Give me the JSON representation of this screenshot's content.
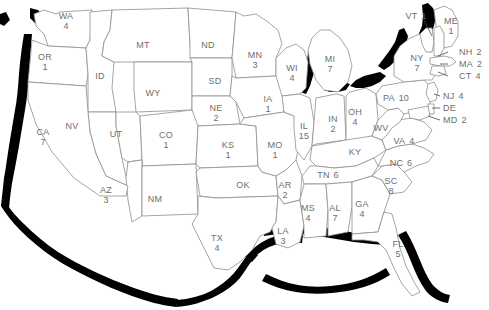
{
  "map": {
    "title": "United States electoral/count map",
    "style": {
      "outline_color": "#1a1a1a",
      "border_color": "#8a8a8a",
      "label_color": "#6e6e6e",
      "fill_color": "#ffffff",
      "shadow_color": "#000000",
      "background": "#ffffff"
    },
    "states": [
      {
        "abbr": "WA",
        "value": "4",
        "x": 66,
        "y": 21,
        "layout": "stack"
      },
      {
        "abbr": "OR",
        "value": "1",
        "x": 45,
        "y": 62,
        "layout": "stack"
      },
      {
        "abbr": "CA",
        "value": "7",
        "x": 43,
        "y": 137,
        "layout": "stack"
      },
      {
        "abbr": "NV",
        "value": "",
        "x": 72,
        "y": 126,
        "layout": "stack"
      },
      {
        "abbr": "ID",
        "value": "",
        "x": 100,
        "y": 76,
        "layout": "stack"
      },
      {
        "abbr": "MT",
        "value": "",
        "x": 143,
        "y": 45,
        "layout": "stack"
      },
      {
        "abbr": "WY",
        "value": "",
        "x": 153,
        "y": 93,
        "layout": "stack"
      },
      {
        "abbr": "UT",
        "value": "",
        "x": 116,
        "y": 134,
        "layout": "stack"
      },
      {
        "abbr": "AZ",
        "value": "3",
        "x": 106,
        "y": 195,
        "layout": "stack"
      },
      {
        "abbr": "NM",
        "value": "",
        "x": 155,
        "y": 199,
        "layout": "stack"
      },
      {
        "abbr": "CO",
        "value": "1",
        "x": 166,
        "y": 140,
        "layout": "stack"
      },
      {
        "abbr": "ND",
        "value": "",
        "x": 208,
        "y": 45,
        "layout": "stack"
      },
      {
        "abbr": "SD",
        "value": "",
        "x": 215,
        "y": 81,
        "layout": "stack"
      },
      {
        "abbr": "NE",
        "value": "2",
        "x": 216,
        "y": 113,
        "layout": "stack"
      },
      {
        "abbr": "KS",
        "value": "1",
        "x": 228,
        "y": 150,
        "layout": "stack"
      },
      {
        "abbr": "OK",
        "value": "",
        "x": 243,
        "y": 185,
        "layout": "stack"
      },
      {
        "abbr": "TX",
        "value": "4",
        "x": 217,
        "y": 243,
        "layout": "stack"
      },
      {
        "abbr": "MN",
        "value": "3",
        "x": 255,
        "y": 60,
        "layout": "stack"
      },
      {
        "abbr": "IA",
        "value": "1",
        "x": 268,
        "y": 104,
        "layout": "stack"
      },
      {
        "abbr": "MO",
        "value": "1",
        "x": 275,
        "y": 150,
        "layout": "stack"
      },
      {
        "abbr": "AR",
        "value": "2",
        "x": 285,
        "y": 190,
        "layout": "stack"
      },
      {
        "abbr": "LA",
        "value": "3",
        "x": 283,
        "y": 236,
        "layout": "stack"
      },
      {
        "abbr": "WI",
        "value": "4",
        "x": 292,
        "y": 73,
        "layout": "stack"
      },
      {
        "abbr": "IL",
        "value": "15",
        "x": 304,
        "y": 131,
        "layout": "stack"
      },
      {
        "abbr": "MS",
        "value": "4",
        "x": 308,
        "y": 213,
        "layout": "stack"
      },
      {
        "abbr": "MI",
        "value": "7",
        "x": 330,
        "y": 64,
        "layout": "stack"
      },
      {
        "abbr": "IN",
        "value": "2",
        "x": 333,
        "y": 124,
        "layout": "stack"
      },
      {
        "abbr": "AL",
        "value": "7",
        "x": 335,
        "y": 213,
        "layout": "stack"
      },
      {
        "abbr": "TN",
        "value": "6",
        "x": 328,
        "y": 175,
        "layout": "inline"
      },
      {
        "abbr": "KY",
        "value": "",
        "x": 355,
        "y": 152,
        "layout": "stack"
      },
      {
        "abbr": "OH",
        "value": "4",
        "x": 355,
        "y": 117,
        "layout": "stack"
      },
      {
        "abbr": "GA",
        "value": "4",
        "x": 362,
        "y": 209,
        "layout": "stack"
      },
      {
        "abbr": "WV",
        "value": "",
        "x": 381,
        "y": 128,
        "layout": "stack"
      },
      {
        "abbr": "SC",
        "value": "8",
        "x": 391,
        "y": 186,
        "layout": "stack"
      },
      {
        "abbr": "FL",
        "value": "5",
        "x": 398,
        "y": 249,
        "layout": "stack"
      },
      {
        "abbr": "VA",
        "value": "4",
        "x": 404,
        "y": 141,
        "layout": "inline"
      },
      {
        "abbr": "NC",
        "value": "6",
        "x": 401,
        "y": 163,
        "layout": "inline"
      },
      {
        "abbr": "PA",
        "value": "10",
        "x": 396,
        "y": 98,
        "layout": "inline"
      },
      {
        "abbr": "NY",
        "value": "7",
        "x": 417,
        "y": 63,
        "layout": "stack"
      },
      {
        "abbr": "ME",
        "value": "1",
        "x": 451,
        "y": 26,
        "layout": "stack"
      }
    ],
    "callouts": [
      {
        "abbr": "VT",
        "value": "1",
        "x": 416,
        "y": 16,
        "align": "center"
      },
      {
        "abbr": "NH",
        "value": "2",
        "x": 459,
        "y": 52,
        "align": "left"
      },
      {
        "abbr": "MA",
        "value": "2",
        "x": 459,
        "y": 64,
        "align": "left"
      },
      {
        "abbr": "CT",
        "value": "4",
        "x": 459,
        "y": 76,
        "align": "left"
      },
      {
        "abbr": "NJ",
        "value": "4",
        "x": 443,
        "y": 96,
        "align": "left"
      },
      {
        "abbr": "DE",
        "value": "",
        "x": 443,
        "y": 108,
        "align": "left"
      },
      {
        "abbr": "MD",
        "value": "2",
        "x": 443,
        "y": 120,
        "align": "left"
      }
    ]
  }
}
